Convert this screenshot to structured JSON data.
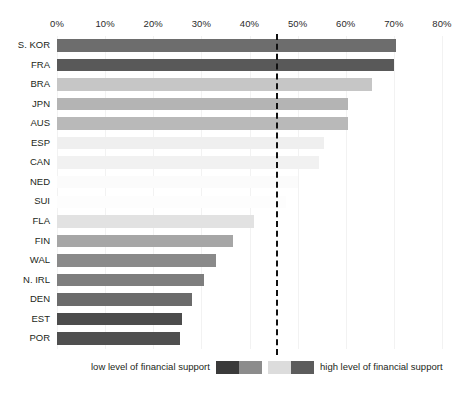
{
  "chart_data": {
    "type": "bar",
    "orientation": "horizontal",
    "title": "",
    "subtitle": "",
    "xlabel": "",
    "ylabel": "",
    "xlim": [
      0,
      80
    ],
    "xtick_labels": [
      "0%",
      "10%",
      "20%",
      "30%",
      "40%",
      "50%",
      "60%",
      "70%",
      "80%"
    ],
    "xtick_values": [
      0,
      10,
      20,
      30,
      40,
      50,
      60,
      70,
      80
    ],
    "grid": true,
    "grid_axis": "x",
    "legend_position": "bottom",
    "categories": [
      "S. KOR",
      "FRA",
      "BRA",
      "JPN",
      "AUS",
      "ESP",
      "CAN",
      "NED",
      "SUI",
      "FLA",
      "FIN",
      "WAL",
      "N. IRL",
      "DEN",
      "EST",
      "POR"
    ],
    "values": [
      70.5,
      70.0,
      65.5,
      60.5,
      60.5,
      55.5,
      54.5,
      50.0,
      47.5,
      41.0,
      36.5,
      33.0,
      30.5,
      28.0,
      26.0,
      25.5
    ],
    "bar_colors": [
      "#6d6d6d",
      "#595959",
      "#c6c6c6",
      "#b4b4b4",
      "#b9b9b9",
      "#efefef",
      "#f1f1f1",
      "#fbfbfb",
      "#fdfdfd",
      "#e2e2e2",
      "#a6a6a6",
      "#8a8a8a",
      "#7e7e7e",
      "#6b6b6b",
      "#4c4c4c",
      "#4f4f4f"
    ],
    "annotations": [
      {
        "type": "vline",
        "name": "threshold-line",
        "value": 45.5,
        "style": "dashed",
        "color": "#111111"
      }
    ],
    "legend_entries": [
      {
        "label": "low level of financial support",
        "label_position": "left",
        "swatches": [
          "#3a3a3a",
          "#8c8c8c"
        ]
      },
      {
        "label": "high level of financial support",
        "label_position": "right",
        "swatches": [
          "#dcdcdc",
          "#5c5c5c"
        ]
      }
    ]
  }
}
